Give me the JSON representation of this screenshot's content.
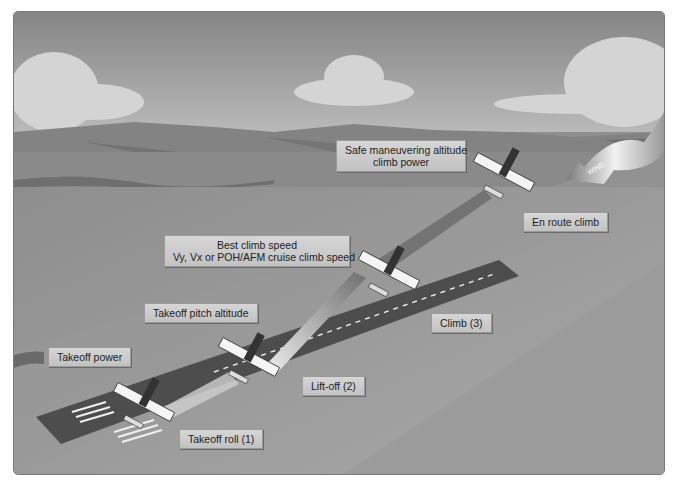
{
  "diagram": {
    "labels": {
      "safe_maneuvering": [
        "Safe maneuvering altitude",
        "climb power"
      ],
      "best_climb": [
        "Best climb speed",
        "Vy, Vx or POH/AFM cruise climb speed"
      ],
      "en_route_climb": "En route climb",
      "takeoff_pitch": "Takeoff pitch altitude",
      "takeoff_power": "Takeoff power",
      "climb": "Climb (3)",
      "lift_off": "Lift-off (2)",
      "takeoff_roll": "Takeoff roll (1)",
      "wind": "WIND"
    },
    "colors": {
      "sky_top": "#8a8a8a",
      "sky_bottom": "#bdbdbd",
      "ground": "#8c8c8c",
      "runway": "#4a4a4a",
      "label_bg": "#cccccc"
    }
  }
}
